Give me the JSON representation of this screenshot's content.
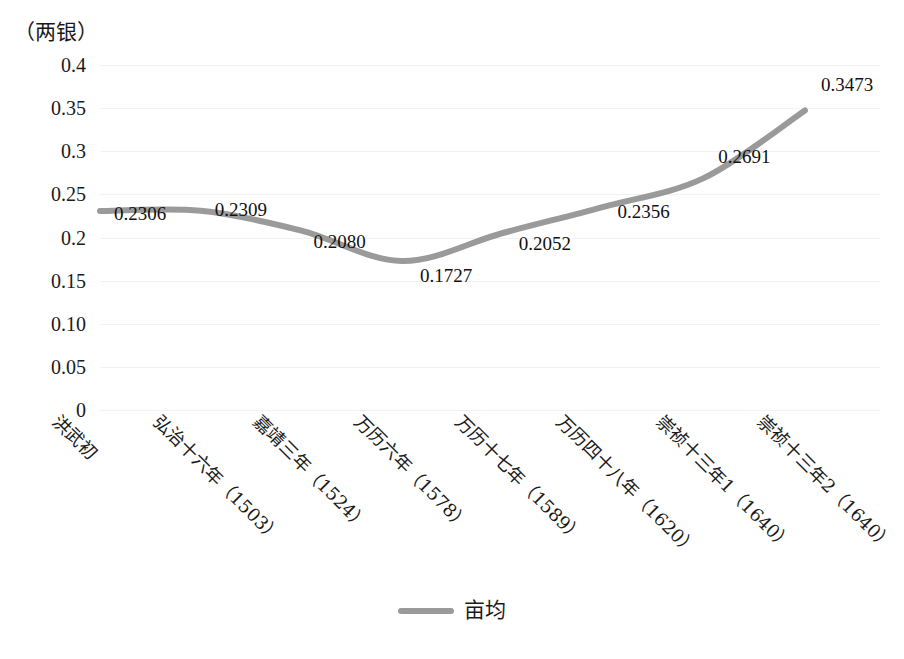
{
  "chart_data": {
    "type": "line",
    "title": "",
    "subtitle": "",
    "xlabel": "",
    "ylabel": "（两银）",
    "y_unit_caption": "（两银）",
    "categories": [
      "洪武初",
      "弘治十六年（1503）",
      "嘉靖三年（1524）",
      "万历六年（1578）",
      "万历十七年（1589）",
      "万历四十八年（1620）",
      "崇祯十三年1（1640）",
      "崇祯十三年2（1640）"
    ],
    "series": [
      {
        "name": "亩均",
        "color": "#9a9a9a",
        "values": [
          0.2306,
          0.2309,
          0.208,
          0.1727,
          0.2052,
          0.2356,
          0.2691,
          0.3473
        ],
        "value_labels": [
          "0.2306",
          "0.2309",
          "0.2080",
          "0.1727",
          "0.2052",
          "0.2356",
          "0.2691",
          "0.3473"
        ]
      }
    ],
    "ylim": [
      0,
      0.4
    ],
    "ytick_labels": [
      "0.4",
      "0.35",
      "0.3",
      "0.25",
      "0.2",
      "0.15",
      "0.10",
      "0.05",
      "0"
    ],
    "ytick_values": [
      0.4,
      0.35,
      0.3,
      0.25,
      0.2,
      0.15,
      0.1,
      0.05,
      0
    ],
    "grid": "horizontal",
    "legend_position": "bottom",
    "legend_entries": [
      "亩均"
    ],
    "smoothed": true
  },
  "legend": {
    "label": "亩均"
  }
}
